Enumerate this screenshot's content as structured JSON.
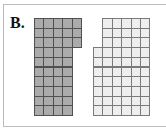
{
  "label": "B.",
  "cell": {
    "w": 9.4,
    "h": 9.7
  },
  "shapes": [
    {
      "name": "left-shaded-figure",
      "style": "dark",
      "origin": {
        "x": 34,
        "y": 18
      },
      "rows": [
        {
          "offset": 0,
          "count": 5
        },
        {
          "offset": 0,
          "count": 5
        },
        {
          "offset": 0,
          "count": 5
        },
        {
          "offset": 0,
          "count": 4
        },
        {
          "offset": 0,
          "count": 4
        },
        {
          "offset": 0,
          "count": 4
        },
        {
          "offset": 0,
          "count": 4
        },
        {
          "offset": 0,
          "count": 4
        },
        {
          "offset": 0,
          "count": 4
        },
        {
          "offset": 0,
          "count": 4
        }
      ]
    },
    {
      "name": "right-light-figure",
      "style": "light",
      "origin": {
        "x": 93,
        "y": 18
      },
      "rows": [
        {
          "offset": 1,
          "count": 5
        },
        {
          "offset": 1,
          "count": 5
        },
        {
          "offset": 1,
          "count": 5
        },
        {
          "offset": 0,
          "count": 6
        },
        {
          "offset": 0,
          "count": 6
        },
        {
          "offset": 0,
          "count": 6
        },
        {
          "offset": 0,
          "count": 6
        },
        {
          "offset": 0,
          "count": 6
        },
        {
          "offset": 0,
          "count": 6
        },
        {
          "offset": 0,
          "count": 6
        }
      ]
    }
  ],
  "colors": {
    "dark_fill": "#ababab",
    "light_fill": "#eeeeee",
    "frame": "#bcbcbc"
  }
}
